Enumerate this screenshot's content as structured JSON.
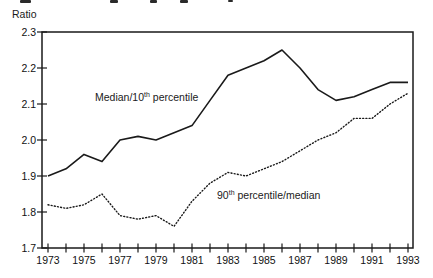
{
  "page": {
    "background": "#ffffff",
    "line_color": "#1a1a1a"
  },
  "y_axis": {
    "label": "Ratio",
    "tick_labels": [
      "1.7",
      "1.8",
      "1.9",
      "2.0",
      "2.1",
      "2.2",
      "2.3"
    ]
  },
  "x_axis": {
    "tick_labels": [
      "1973",
      "1975",
      "1977",
      "1979",
      "1981",
      "1983",
      "1985",
      "1987",
      "1989",
      "1991",
      "1993"
    ]
  },
  "chart_data": {
    "type": "line",
    "title": "",
    "xlabel": "",
    "ylabel": "Ratio",
    "xlim": [
      1973,
      1993
    ],
    "ylim": [
      1.7,
      2.3
    ],
    "grid": false,
    "legend_position": "inline-annotations",
    "x": [
      1973,
      1974,
      1975,
      1976,
      1977,
      1978,
      1979,
      1980,
      1981,
      1982,
      1983,
      1984,
      1985,
      1986,
      1987,
      1988,
      1989,
      1990,
      1991,
      1992,
      1993
    ],
    "x_tick_labels": [
      "1973",
      "1975",
      "1977",
      "1979",
      "1981",
      "1983",
      "1985",
      "1987",
      "1989",
      "1991",
      "1993"
    ],
    "y_tick_labels": [
      "1.7",
      "1.8",
      "1.9",
      "2.0",
      "2.1",
      "2.2",
      "2.3"
    ],
    "series": [
      {
        "name": "Median/10th percentile",
        "style": "solid",
        "color": "#1a1a1a",
        "values": [
          1.9,
          1.92,
          1.96,
          1.94,
          2.0,
          2.01,
          2.0,
          2.02,
          2.04,
          2.11,
          2.18,
          2.2,
          2.22,
          2.25,
          2.2,
          2.14,
          2.11,
          2.12,
          2.14,
          2.16,
          2.16
        ]
      },
      {
        "name": "90th percentile/median",
        "style": "dotted",
        "color": "#1a1a1a",
        "values": [
          1.82,
          1.81,
          1.82,
          1.85,
          1.79,
          1.78,
          1.79,
          1.76,
          1.83,
          1.88,
          1.91,
          1.9,
          1.92,
          1.94,
          1.97,
          2.0,
          2.02,
          2.06,
          2.06,
          2.1,
          2.13
        ]
      }
    ],
    "annotations": [
      {
        "pre": "Median/10",
        "sup": "th",
        "post": " percentile"
      },
      {
        "pre": "90",
        "sup": "th",
        "post": " percentile/median"
      }
    ]
  }
}
